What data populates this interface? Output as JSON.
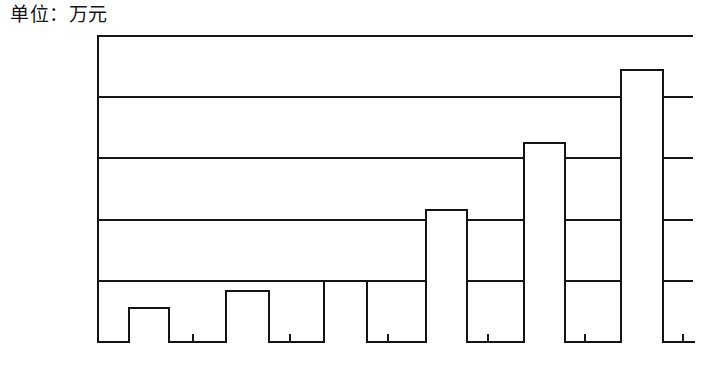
{
  "caption": {
    "unit_label": "单位：万元"
  },
  "axis": {
    "x_title": "年份",
    "y_tick_labels": [
      "0",
      "5 000",
      "10 000",
      "15 000",
      "20 000",
      "25 000"
    ],
    "x_tick_labels": [
      "2001",
      "2002",
      "2003",
      "2004",
      "2005",
      "2006"
    ]
  },
  "style": {
    "ink_color": "#141414",
    "bar_fill": "#ffffff",
    "page_background": "#ffffff"
  },
  "chart_data": {
    "type": "bar",
    "title": "单位：万元",
    "xlabel": "年份",
    "ylabel": "万元",
    "categories": [
      "2001",
      "2002",
      "2003",
      "2004",
      "2005",
      "2006"
    ],
    "values": [
      2800,
      4200,
      5000,
      10800,
      16300,
      22200
    ],
    "ylim": [
      0,
      25000
    ],
    "ytick_values": [
      0,
      5000,
      10000,
      15000,
      20000,
      25000
    ],
    "ytick_labels": [
      "0",
      "5 000",
      "10 000",
      "15 000",
      "20 000",
      "25 000"
    ],
    "grid": "horizontal",
    "legend": "none",
    "series": [
      {
        "name": "金额",
        "values": [
          2800,
          4200,
          5000,
          10800,
          16300,
          22200
        ]
      }
    ]
  }
}
